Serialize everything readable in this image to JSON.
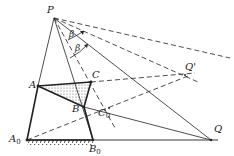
{
  "diagram": {
    "type": "linkage-mechanism",
    "colors": {
      "line": "#222222",
      "background": "#ffffff",
      "fill_dots": "#555555"
    },
    "points": {
      "P": {
        "label": "P",
        "x": 54,
        "y": 18
      },
      "A": {
        "label": "A",
        "x": 38,
        "y": 86
      },
      "B": {
        "label": "B",
        "x": 84,
        "y": 107
      },
      "C": {
        "label": "C",
        "x": 91,
        "y": 82
      },
      "A0": {
        "label": "A",
        "sub": "0",
        "x": 27,
        "y": 140
      },
      "B0": {
        "label": "B",
        "sub": "0",
        "x": 93,
        "y": 140
      },
      "Q": {
        "label": "Q",
        "x": 211,
        "y": 140
      },
      "Qp": {
        "label": "Q'",
        "x": 185,
        "y": 75
      },
      "C0": {
        "label": "C",
        "sub": "0",
        "x": 109,
        "y": 108
      }
    },
    "angles": [
      {
        "label": "β",
        "x": 74,
        "y": 35
      },
      {
        "label": "β",
        "x": 79,
        "y": 49
      }
    ]
  }
}
